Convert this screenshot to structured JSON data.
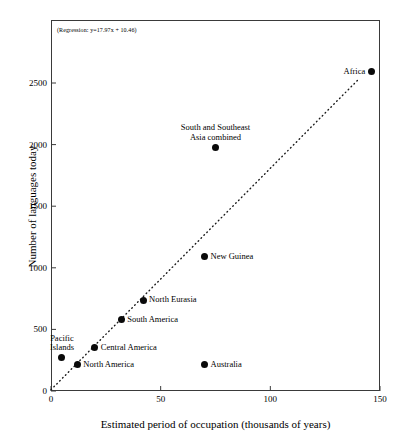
{
  "chart_data": {
    "type": "scatter",
    "title": "",
    "xlabel": "Estimated period of occupation (thousands of years)",
    "ylabel": "Number of languages today",
    "xlim": [
      0,
      150
    ],
    "ylim": [
      0,
      2700
    ],
    "xticks": [
      "0",
      "50",
      "100",
      "150"
    ],
    "xtick_values": [
      0,
      50,
      100,
      150
    ],
    "yticks": [
      "0",
      "500",
      "1000",
      "1500",
      "2000",
      "2500"
    ],
    "ytick_values": [
      0,
      500,
      1000,
      1500,
      2000,
      2500
    ],
    "grid": false,
    "legend": "none",
    "annotation": "(Regression:  y=17.97x + 10.46)",
    "regression": {
      "slope": 17.97,
      "intercept": 10.46,
      "style": "dotted",
      "x_start": 0,
      "x_end": 140
    },
    "points": [
      {
        "label": "Pacific Islands",
        "x": 5,
        "y": 270,
        "label_pos": "above",
        "lines": [
          "Pacific",
          "Islands"
        ]
      },
      {
        "label": "North America",
        "x": 12,
        "y": 215,
        "label_pos": "right",
        "lines": [
          "North America"
        ]
      },
      {
        "label": "Central America",
        "x": 20,
        "y": 350,
        "label_pos": "right",
        "lines": [
          "Central America"
        ]
      },
      {
        "label": "South America",
        "x": 32,
        "y": 580,
        "label_pos": "right",
        "lines": [
          "South America"
        ]
      },
      {
        "label": "North Eurasia",
        "x": 42,
        "y": 735,
        "label_pos": "right",
        "lines": [
          "North Eurasia"
        ]
      },
      {
        "label": "New Guinea",
        "x": 70,
        "y": 1090,
        "label_pos": "right",
        "lines": [
          "New Guinea"
        ]
      },
      {
        "label": "Australia",
        "x": 70,
        "y": 215,
        "label_pos": "right",
        "lines": [
          "Australia"
        ]
      },
      {
        "label": "South and Southeast Asia combined",
        "x": 75,
        "y": 1980,
        "label_pos": "above",
        "lines": [
          "South and Southeast",
          "Asia combined"
        ]
      },
      {
        "label": "Africa",
        "x": 146,
        "y": 2590,
        "label_pos": "left",
        "lines": [
          "Africa"
        ]
      }
    ]
  },
  "colors": {
    "marker": "#0a0a0a",
    "axis": "#3a3a3a",
    "text": "#000000",
    "background": "#ffffff"
  }
}
